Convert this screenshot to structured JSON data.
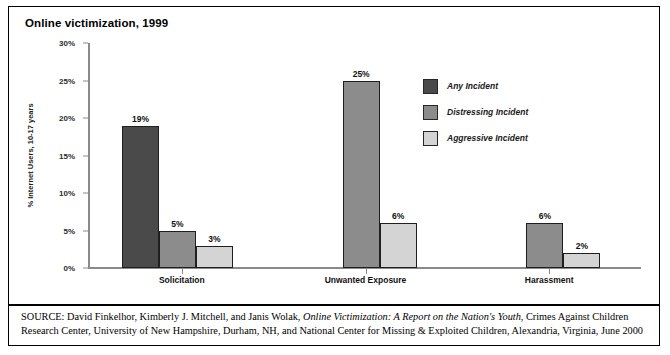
{
  "figure": {
    "title": "Online victimization, 1999",
    "source_label": "SOURCE:",
    "source_text_1": " David Finkelhor, Kimberly J. Mitchell, and Janis Wolak, ",
    "source_title_italic": "Online Victimization: A Report on the Nation's Youth",
    "source_text_2": ", Crimes Against Children Research Center, University of New Hampshire, Durham, NH, and National Center for Missing & Exploited Children, Alexandria, Virginia, June 2000"
  },
  "chart_data": {
    "type": "bar",
    "title": "Online victimization, 1999",
    "xlabel": "",
    "ylabel": "% Internet Users, 10-17 years",
    "ylim": [
      0,
      30
    ],
    "ytick_labels": [
      "0%",
      "5%",
      "10%",
      "15%",
      "20%",
      "25%",
      "30%"
    ],
    "ytick_values": [
      0,
      5,
      10,
      15,
      20,
      25,
      30
    ],
    "grid": false,
    "legend_position": "upper-right-inside",
    "categories": [
      "Solicitation",
      "Unwanted Exposure",
      "Harassment"
    ],
    "series": [
      {
        "name": "Any Incident",
        "color": "#4a4a4a",
        "values": [
          19,
          null,
          null
        ],
        "labels": [
          "19%",
          "",
          ""
        ]
      },
      {
        "name": "Distressing Incident",
        "color": "#8c8c8c",
        "values": [
          5,
          25,
          6
        ],
        "labels": [
          "5%",
          "25%",
          "6%"
        ]
      },
      {
        "name": "Aggressive Incident",
        "color": "#d4d4d4",
        "values": [
          3,
          6,
          2
        ],
        "labels": [
          "3%",
          "6%",
          "2%"
        ]
      }
    ]
  }
}
